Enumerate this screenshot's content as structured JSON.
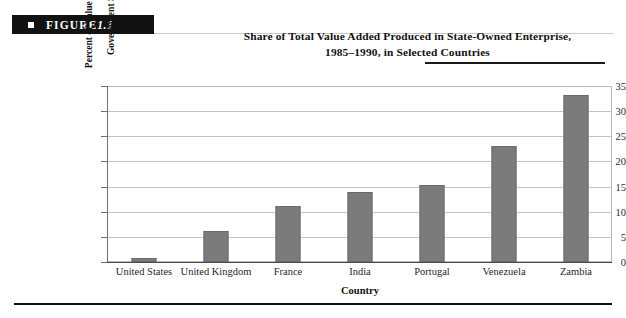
{
  "figure": {
    "label_prefix": "FIGURE",
    "number": "1.1",
    "bullet_icon": "square-bullet-icon"
  },
  "title": {
    "line1": "Share of Total Value Added Produced in State-Owned Enterprise,",
    "line2": "1985–1990, in Selected Countries"
  },
  "chart_data": {
    "type": "bar",
    "title": "Share of Total Value Added Produced in State-Owned Enterprise, 1985–1990, in Selected Countries",
    "xlabel": "Country",
    "ylabel": "Percent of Value Added in Government Sector",
    "ylabel_line1": "Percent of Value Added in",
    "ylabel_line2": "Government Sector",
    "categories": [
      "United States",
      "United Kingdom",
      "France",
      "India",
      "Portugal",
      "Venezuela",
      "Zambia"
    ],
    "values": [
      0.8,
      6.2,
      11.1,
      13.9,
      15.3,
      23.0,
      33.3
    ],
    "ylim": [
      0,
      35
    ],
    "ytick_values": [
      0,
      5,
      10,
      15,
      20,
      25,
      30,
      35
    ],
    "ytick_labels": [
      "0",
      "5",
      "10",
      "15",
      "20",
      "25",
      "30",
      "35"
    ],
    "grid": true,
    "grid_axis": "y",
    "legend": false,
    "bar_color": "#7b7b7b",
    "bar_edge_color": "#6a6a6a",
    "grid_color": "#c3c3c3",
    "background_color": "#ffffff"
  }
}
